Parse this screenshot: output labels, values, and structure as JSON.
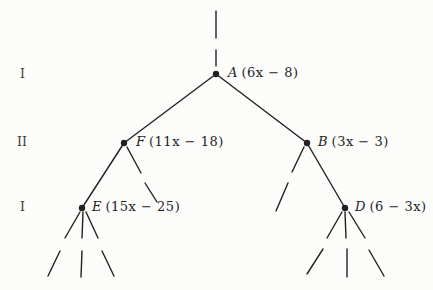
{
  "figure": {
    "type": "tree-diagram",
    "background_color": "#fcfcfa",
    "line_color": "#222222",
    "text_color": "#1e1e1e",
    "levels": [
      {
        "label": "I"
      },
      {
        "label": "II"
      },
      {
        "label": "I"
      }
    ],
    "nodes": [
      {
        "id": "A",
        "name": "A",
        "expr": "(6x − 8)",
        "level": "I"
      },
      {
        "id": "F",
        "name": "F",
        "expr": "(11x − 18)",
        "level": "II"
      },
      {
        "id": "B",
        "name": "B",
        "expr": "(3x − 3)",
        "level": "II"
      },
      {
        "id": "E",
        "name": "E",
        "expr": "(15x − 25)",
        "level": "I"
      },
      {
        "id": "D",
        "name": "D",
        "expr": "(6 − 3x)",
        "level": "I"
      }
    ]
  }
}
